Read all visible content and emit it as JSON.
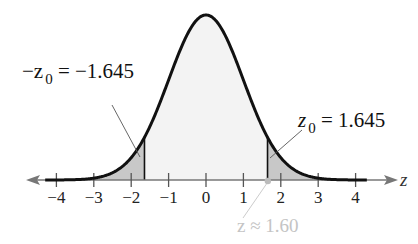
{
  "chart_data": {
    "type": "area",
    "title": "",
    "xlabel": "z",
    "ylabel": "",
    "xlim": [
      -4.3,
      4.5
    ],
    "x_ticks": [
      -4,
      -3,
      -2,
      -1,
      0,
      1,
      2,
      3,
      4
    ],
    "x_tick_labels": [
      "−4",
      "−3",
      "−2",
      "−1",
      "0",
      "1",
      "2",
      "3",
      "4"
    ],
    "grid": false,
    "curve": {
      "distribution": "normal",
      "mean": 0,
      "sd": 1
    },
    "shaded_regions": [
      {
        "from": -4.3,
        "to": -1.645,
        "color": "#c8c8c8"
      },
      {
        "from": 1.645,
        "to": 4.5,
        "color": "#c8c8c8"
      }
    ],
    "center_fill": "#f3f3f3",
    "annotations": [
      {
        "text_left": "−z",
        "sub": "0",
        "text_right": " = −1.645",
        "at": -1.645
      },
      {
        "text_left": "z",
        "sub": "0",
        "text_right": " = 1.645",
        "at": 1.645
      },
      {
        "text": "z ≈ 1.60",
        "at": 1.6,
        "style": "faded"
      }
    ]
  },
  "labels": {
    "axis_var": "z",
    "left_prefix": "−z",
    "left_sub": "0",
    "left_value": " = −1.645",
    "right_prefix": "z",
    "right_sub": "0",
    "right_value": " = 1.645",
    "approx": "z ≈ 1.60",
    "ticks": [
      "−4",
      "−3",
      "−2",
      "−1",
      "0",
      "1",
      "2",
      "3",
      "4"
    ]
  }
}
